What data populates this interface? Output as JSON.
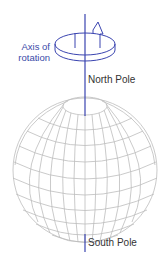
{
  "labels": {
    "axis_line1": "Axis of",
    "axis_line2": "rotation",
    "north_pole": "North Pole",
    "south_pole": "South Pole"
  },
  "colors": {
    "axis": "#3a44b0",
    "grid": "#b8b8b8",
    "label_axis": "#3a4aa8",
    "label_text": "#333333"
  }
}
